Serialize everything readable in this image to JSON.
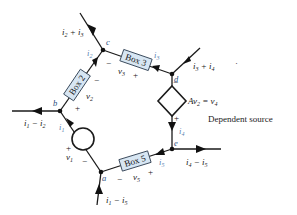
{
  "diagram": {
    "type": "circuit",
    "nodes": [
      {
        "id": "a",
        "label": "a"
      },
      {
        "id": "b",
        "label": "b"
      },
      {
        "id": "c",
        "label": "c"
      },
      {
        "id": "d",
        "label": "d"
      },
      {
        "id": "e",
        "label": "e"
      }
    ],
    "boxes": {
      "box2": "Box 2",
      "box3": "Box 3",
      "box5": "Box 5"
    },
    "voltages": {
      "v1": "v",
      "v1_sub": "1",
      "v2": "v",
      "v2_sub": "2",
      "v3": "v",
      "v3_sub": "3",
      "v5": "v",
      "v5_sub": "5"
    },
    "branch_currents": {
      "i1": [
        "i",
        "1"
      ],
      "i2": [
        "i",
        "2"
      ],
      "i3": [
        "i",
        "3"
      ],
      "i4": [
        "i",
        "4"
      ],
      "i5": [
        "i",
        "5"
      ]
    },
    "external_currents": {
      "c_top": "i2 + i3",
      "d_top": "i3 + i4",
      "b_left": "i1 − i2",
      "e_right": "i4 − i5",
      "a_bottom": "i1 − i5"
    },
    "dependent_source": {
      "equation_lhs": "Av",
      "equation_lhs_sub": "2",
      "equation_eq": " = v",
      "equation_rhs_sub": "4",
      "caption": "Dependent source"
    },
    "signs": {
      "plus": "+",
      "minus": "−"
    },
    "stray_mark": "·"
  }
}
